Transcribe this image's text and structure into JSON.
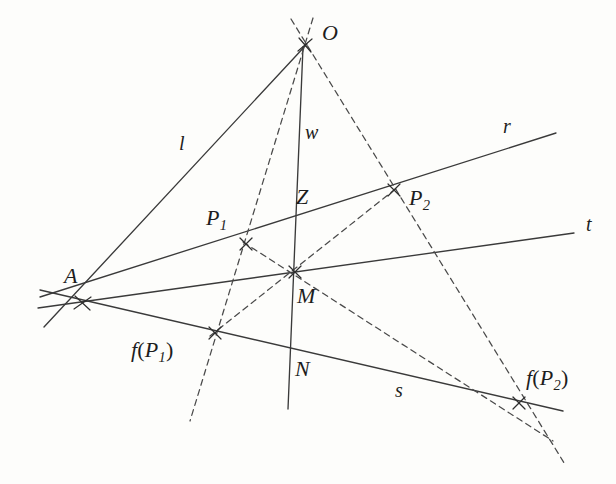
{
  "figure": {
    "kind": "geometry-diagram",
    "background_color": "#fdfdfb",
    "stroke_color": "#3a3a3a",
    "dash_color": "#4a4a4a"
  },
  "labels": {
    "O": "O",
    "A": "A",
    "l": "l",
    "w": "w",
    "r": "r",
    "t": "t",
    "s": "s",
    "Z": "Z",
    "M": "M",
    "N": "N",
    "P1_name": "P",
    "P1_sub": "1",
    "P2_name": "P",
    "P2_sub": "2",
    "fP1_f": "f",
    "fP1_open": "(",
    "fP1_name": "P",
    "fP1_sub": "1",
    "fP1_close": ")",
    "fP2_f": "f",
    "fP2_open": "(",
    "fP2_name": "P",
    "fP2_sub": "2",
    "fP2_close": ")"
  },
  "points": [
    {
      "id": "O",
      "label": "O",
      "x": 305,
      "y": 45,
      "label_x": 322,
      "label_y": 30
    },
    {
      "id": "A",
      "label": "A",
      "x": 82,
      "y": 303,
      "label_x": 66,
      "label_y": 266
    },
    {
      "id": "P1",
      "label": "P1",
      "x": 246,
      "y": 244,
      "label_x": 208,
      "label_y": 208
    },
    {
      "id": "P2",
      "label": "P2",
      "x": 394,
      "y": 190,
      "label_x": 412,
      "label_y": 189
    },
    {
      "id": "fP1",
      "label": "f(P1)",
      "x": 215,
      "y": 333,
      "label_x": 134,
      "label_y": 338
    },
    {
      "id": "fP2",
      "label": "f(P2)",
      "x": 519,
      "y": 403,
      "label_x": 528,
      "label_y": 368
    },
    {
      "id": "M",
      "label": "M",
      "x": 295,
      "y": 272,
      "label_x": 299,
      "label_y": 286
    },
    {
      "id": "N",
      "label": "N",
      "x": 290,
      "y": 351,
      "label_x": 296,
      "label_y": 359
    },
    {
      "id": "Z",
      "label": "Z",
      "x": 299,
      "y": 218,
      "label_x": 298,
      "label_y": 186
    }
  ],
  "line_labels": [
    {
      "id": "l",
      "label": "l",
      "x": 181,
      "y": 135
    },
    {
      "id": "w",
      "label": "w",
      "x": 310,
      "y": 122
    },
    {
      "id": "r",
      "label": "r",
      "x": 505,
      "y": 117
    },
    {
      "id": "t",
      "label": "t",
      "x": 588,
      "y": 215
    },
    {
      "id": "s",
      "label": "s",
      "x": 396,
      "y": 381
    }
  ],
  "segments": {
    "solid": [
      {
        "name": "line-l",
        "x1": 44,
        "y1": 327,
        "x2": 307,
        "y2": 44
      },
      {
        "name": "line-w",
        "x1": 303,
        "y1": 47,
        "x2": 288,
        "y2": 409
      },
      {
        "name": "line-r",
        "x1": 40,
        "y1": 297,
        "x2": 556,
        "y2": 133
      },
      {
        "name": "line-t",
        "x1": 38,
        "y1": 308,
        "x2": 574,
        "y2": 233
      },
      {
        "name": "line-s",
        "x1": 40,
        "y1": 290,
        "x2": 563,
        "y2": 411
      }
    ],
    "dashed": [
      {
        "name": "dash-O-to-fP1",
        "x1": 313,
        "y1": 18,
        "x2": 190,
        "y2": 421
      },
      {
        "name": "dash-O-to-fP2",
        "x1": 291,
        "y1": 19,
        "x2": 566,
        "y2": 466
      },
      {
        "name": "dash-P1-to-fP2",
        "x1": 246,
        "y1": 244,
        "x2": 553,
        "y2": 441
      },
      {
        "name": "dash-P2-to-fP1",
        "x1": 394,
        "y1": 190,
        "x2": 212,
        "y2": 334
      },
      {
        "name": "dash-P1-to-M-fP2-upper",
        "x1": 246,
        "y1": 244,
        "x2": 520,
        "y2": 402
      },
      {
        "name": "dash-fP1-to-P2-through-M",
        "x1": 215,
        "y1": 333,
        "x2": 396,
        "y2": 189
      }
    ]
  },
  "colors": {
    "ink": "#3a3a3a",
    "dash_ink": "#4a4a4a",
    "text": "#1d1d1d",
    "paper": "#fdfdfb"
  }
}
